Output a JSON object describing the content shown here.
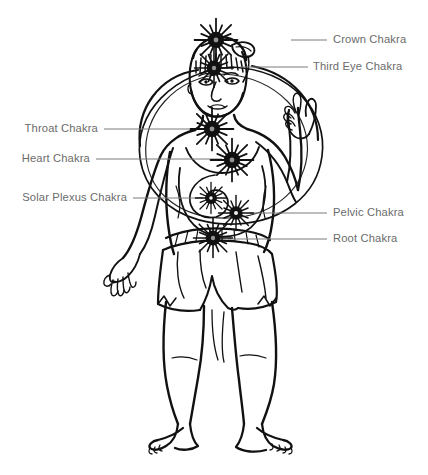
{
  "diagram": {
    "background_color": "#ffffff",
    "line_color": "#111111",
    "label_color": "#6b6b6b",
    "leader_color": "#7a7a7a",
    "labels": [
      {
        "id": "crown",
        "text": "Crown Chakra",
        "side": "right",
        "text_x": 333,
        "text_y": 34,
        "leader_x1": 291,
        "leader_x2": 327,
        "leader_y": 40,
        "chakra_x": 216,
        "chakra_y": 40,
        "chakra_r": 11
      },
      {
        "id": "third-eye",
        "text": "Third Eye Chakra",
        "side": "right",
        "text_x": 313,
        "text_y": 61,
        "leader_x1": 240,
        "leader_x2": 308,
        "leader_y": 67,
        "chakra_x": 214,
        "chakra_y": 68,
        "chakra_r": 10
      },
      {
        "id": "throat",
        "text": "Throat Chakra",
        "side": "left",
        "text_x": 16,
        "text_y": 123,
        "leader_x1": 104,
        "leader_x2": 205,
        "leader_y": 129,
        "chakra_x": 212,
        "chakra_y": 129,
        "chakra_r": 11
      },
      {
        "id": "heart",
        "text": "Heart Chakra",
        "side": "left",
        "text_x": 16,
        "text_y": 153,
        "leader_x1": 96,
        "leader_x2": 222,
        "leader_y": 159,
        "chakra_x": 232,
        "chakra_y": 160,
        "chakra_r": 11
      },
      {
        "id": "solar-plexus",
        "text": "Solar Plexus Chakra",
        "side": "left",
        "text_x": 16,
        "text_y": 192,
        "leader_x1": 133,
        "leader_x2": 203,
        "leader_y": 198,
        "chakra_x": 211,
        "chakra_y": 198,
        "chakra_r": 8
      },
      {
        "id": "pelvic",
        "text": "Pelvic Chakra",
        "side": "right",
        "text_x": 333,
        "text_y": 207,
        "leader_x1": 249,
        "leader_x2": 327,
        "leader_y": 213,
        "chakra_x": 236,
        "chakra_y": 213,
        "chakra_r": 9
      },
      {
        "id": "root",
        "text": "Root Chakra",
        "side": "right",
        "text_x": 333,
        "text_y": 233,
        "leader_x1": 228,
        "leader_x2": 327,
        "leader_y": 239,
        "chakra_x": 213,
        "chakra_y": 238,
        "chakra_r": 10
      }
    ],
    "figure_parts": [
      "head",
      "face",
      "hair",
      "raised-right-hand",
      "lowered-left-hand",
      "torso",
      "belly-spiral",
      "wrap-skirt",
      "legs",
      "feet",
      "aura-circles"
    ]
  }
}
